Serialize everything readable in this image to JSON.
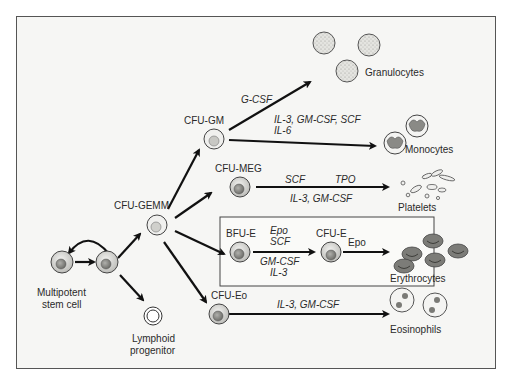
{
  "diagram": {
    "title": "",
    "nodes": {
      "stem_cell": "Multipotent\nstem cell",
      "stem_cell_line1": "Multipotent",
      "stem_cell_line2": "stem cell",
      "lymphoid_line1": "Lymphoid",
      "lymphoid_line2": "progenitor",
      "cfu_gemm": "CFU-GEMM",
      "cfu_gm": "CFU-GM",
      "cfu_meg": "CFU-MEG",
      "bfu_e": "BFU-E",
      "cfu_e": "CFU-E",
      "cfu_eo": "CFU-Eo"
    },
    "outputs": {
      "granulocytes": "Granulocytes",
      "monocytes": "Monocytes",
      "platelets": "Platelets",
      "erythrocytes": "Erythrocytes",
      "eosinophils": "Eosinophils"
    },
    "cytokines": {
      "granulocytes": "G-CSF",
      "monocytes_line1": "IL-3, GM-CSF, SCF",
      "monocytes_line2": "IL-6",
      "platelets_top_left": "SCF",
      "platelets_top_right": "TPO",
      "platelets_bottom": "IL-3, GM-CSF",
      "bfu_top_line1": "Epo",
      "bfu_top_line2": "SCF",
      "bfu_bottom_line1": "GM-CSF",
      "bfu_bottom_line2": "IL-3",
      "cfu_e": "Epo",
      "eosinophils": "IL-3, GM-CSF"
    },
    "edges": [
      {
        "from": "stem_cell",
        "to": "stem_cell",
        "label": "self-renewal"
      },
      {
        "from": "stem_cell",
        "to": "cfu_gemm"
      },
      {
        "from": "stem_cell",
        "to": "lymphoid_progenitor"
      },
      {
        "from": "cfu_gemm",
        "to": "cfu_gm"
      },
      {
        "from": "cfu_gemm",
        "to": "cfu_meg"
      },
      {
        "from": "cfu_gemm",
        "to": "bfu_e"
      },
      {
        "from": "cfu_gemm",
        "to": "cfu_eo"
      },
      {
        "from": "cfu_gm",
        "to": "granulocytes",
        "cytokines": "G-CSF"
      },
      {
        "from": "cfu_gm",
        "to": "monocytes",
        "cytokines": "IL-3, GM-CSF, SCF, IL-6"
      },
      {
        "from": "cfu_meg",
        "to": "platelets",
        "cytokines": "SCF, TPO, IL-3, GM-CSF"
      },
      {
        "from": "bfu_e",
        "to": "cfu_e",
        "cytokines": "Epo, SCF, GM-CSF, IL-3"
      },
      {
        "from": "cfu_e",
        "to": "erythrocytes",
        "cytokines": "Epo"
      },
      {
        "from": "cfu_eo",
        "to": "eosinophils",
        "cytokines": "IL-3, GM-CSF"
      }
    ],
    "colors": {
      "background": "#f6f6f4",
      "frame": "#555555",
      "arrow": "#111111",
      "cell_light": "#e8e8e6",
      "cell_mid": "#c4c4c0",
      "nucleus_dark": "#8a8a86",
      "erythrocyte": "#7c7c78",
      "box_fill": "#fafaf8"
    }
  }
}
